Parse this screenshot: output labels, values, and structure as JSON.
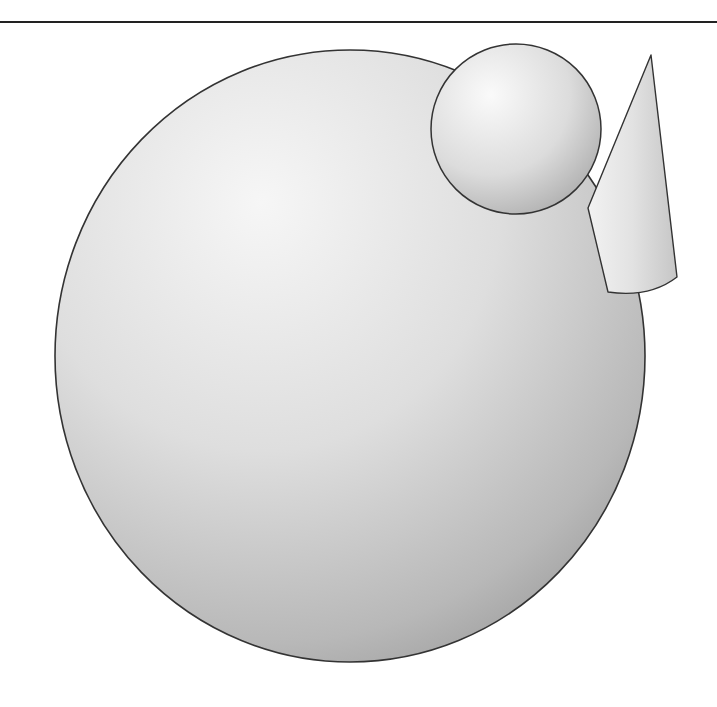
{
  "figure": {
    "colors": {
      "background": "#ffffff",
      "rule": "#222222",
      "outline": "#333333",
      "highlight": "#f4f4f4",
      "midtone": "#d2d2d2",
      "shadow": "#9c9c9c"
    },
    "objects": [
      {
        "name": "large-sphere",
        "cx": 350,
        "cy": 356,
        "rx": 295,
        "ry": 306
      },
      {
        "name": "small-sphere",
        "cx": 516,
        "cy": 129,
        "r": 85
      },
      {
        "name": "cone",
        "apex": [
          651,
          55
        ],
        "base": [
          [
            588,
            208
          ],
          [
            608,
            292
          ],
          [
            677,
            278
          ]
        ]
      }
    ]
  }
}
